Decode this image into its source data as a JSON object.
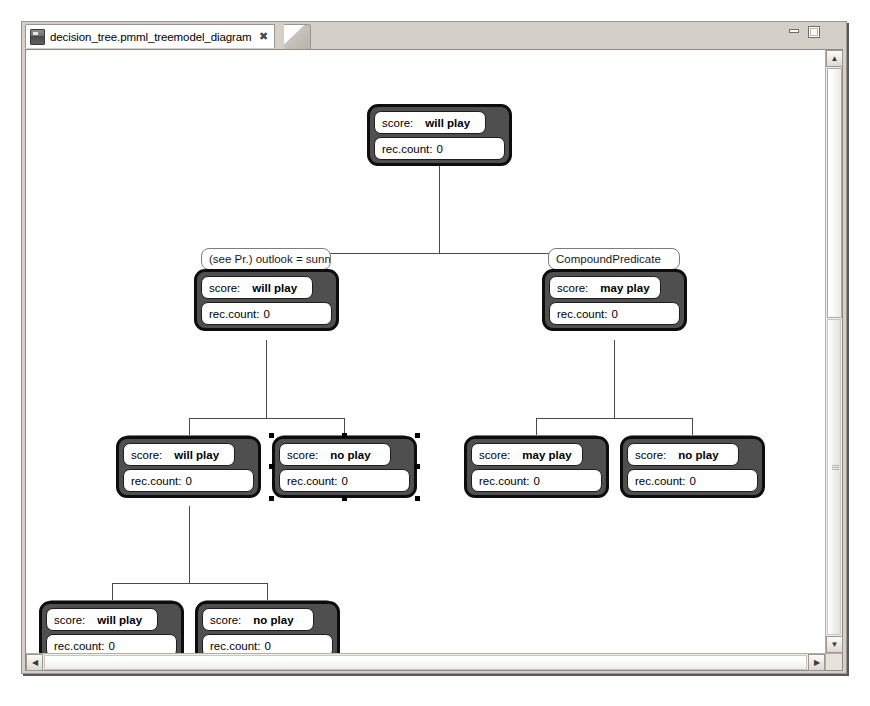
{
  "window": {
    "minimize_label": "minimize",
    "maximize_label": "maximize"
  },
  "tab": {
    "title": "decision_tree.pmml_treemodel_diagram",
    "close_glyph": "✖",
    "icon_name": "file-icon"
  },
  "scrollbars": {
    "v_up_glyph": "▲",
    "v_down_glyph": "▼",
    "h_left_glyph": "◀",
    "h_right_glyph": "▶"
  },
  "labels": {
    "score_key": "score:",
    "count_key": "rec.count:"
  },
  "diagram": {
    "nodes": [
      {
        "id": "root",
        "predicate": null,
        "score": "will play",
        "rec_count": "0",
        "selected": false
      },
      {
        "id": "n-l1",
        "predicate": "(see Pr.) outlook = sunny",
        "score": "will play",
        "rec_count": "0",
        "selected": false
      },
      {
        "id": "n-r1",
        "predicate": "CompoundPredicate",
        "score": "may play",
        "rec_count": "0",
        "selected": false
      },
      {
        "id": "n-ll2",
        "predicate": "CompoundPredicate",
        "score": "will play",
        "rec_count": "0",
        "selected": false
      },
      {
        "id": "n-lr2",
        "predicate": "CompoundPredicate",
        "score": "no play",
        "rec_count": "0",
        "selected": true
      },
      {
        "id": "n-rl2",
        "predicate": "CompoundPredicate",
        "score": "may play",
        "rec_count": "0",
        "selected": false
      },
      {
        "id": "n-rr2",
        "predicate": "CompoundPredicate",
        "score": "no play",
        "rec_count": "0",
        "selected": false
      },
      {
        "id": "n-lll3",
        "predicate": "(see Pr.) humidity < 80",
        "score": "will play",
        "rec_count": "0",
        "selected": false
      },
      {
        "id": "n-llr3",
        "predicate": "(see Pr.) humidity >= 80",
        "score": "no play",
        "rec_count": "0",
        "selected": false
      }
    ]
  }
}
